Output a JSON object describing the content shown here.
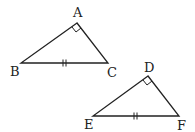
{
  "diagram": {
    "type": "congruent-right-triangles",
    "triangles": [
      {
        "name": "ABC",
        "vertices": {
          "A": "A",
          "B": "B",
          "C": "C"
        },
        "right_angle_at": "A",
        "tick_marked_side": "BC",
        "tick_count": 2
      },
      {
        "name": "DEF",
        "vertices": {
          "D": "D",
          "E": "E",
          "F": "F"
        },
        "right_angle_at": "D",
        "tick_marked_side": "EF",
        "tick_count": 2
      }
    ]
  }
}
